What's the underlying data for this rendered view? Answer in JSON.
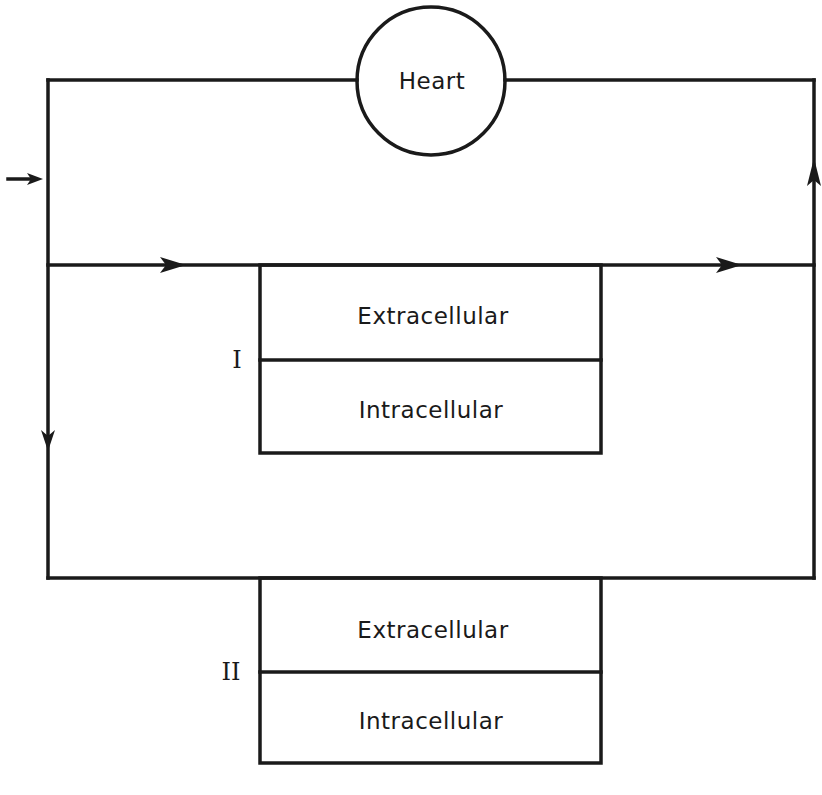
{
  "diagram": {
    "type": "circulatory compartment flow diagram",
    "colors": {
      "line": "#1a1a1a",
      "background": "#ffffff"
    },
    "heart": {
      "label": "Heart"
    },
    "compartments": [
      {
        "id": "I",
        "label": "I",
        "top": "Extracellular",
        "bottom": "Intracellular"
      },
      {
        "id": "II",
        "label": "II",
        "top": "Extracellular",
        "bottom": "Intracellular"
      }
    ],
    "flow_arrows": [
      {
        "location": "inlet-left",
        "direction": "right"
      },
      {
        "location": "middle-line-left",
        "direction": "right"
      },
      {
        "location": "middle-line-right",
        "direction": "right"
      },
      {
        "location": "left-branch",
        "direction": "down"
      },
      {
        "location": "right-return",
        "direction": "up"
      }
    ]
  }
}
